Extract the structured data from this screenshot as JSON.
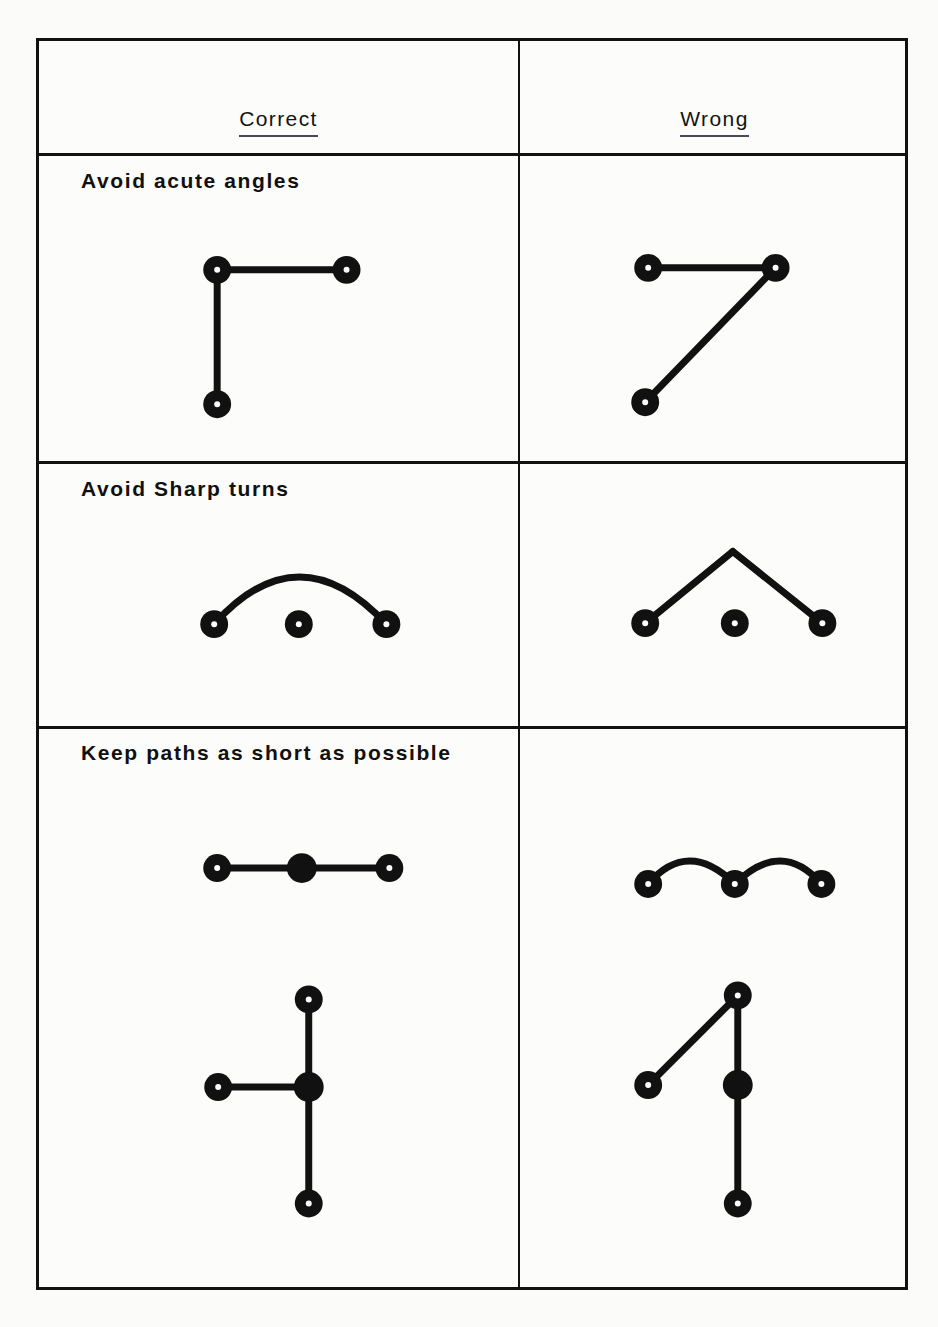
{
  "page": {
    "background_color": "#fcfcfa",
    "ink_color": "#111111"
  },
  "table": {
    "headers": [
      {
        "key": "correct",
        "label": "Correct"
      },
      {
        "key": "wrong",
        "label": "Wrong"
      }
    ],
    "rows": [
      {
        "id": "row-acute-angles",
        "label": "Avoid  acute  angles"
      },
      {
        "id": "row-sharp-turns",
        "label": "Avoid  Sharp  turns"
      },
      {
        "id": "row-short-paths",
        "label": "Keep  paths  as  short  as  possible"
      }
    ]
  },
  "diagrams": {
    "row1_correct": {
      "name": "right-angle-path",
      "description": "Two segments meeting at a 90 degree corner",
      "nodes": [
        {
          "x": 215,
          "y": 267,
          "style": "terminal"
        },
        {
          "x": 345,
          "y": 267,
          "style": "terminal"
        },
        {
          "x": 215,
          "y": 402,
          "style": "terminal"
        }
      ],
      "segments": [
        {
          "from": [
            215,
            267
          ],
          "to": [
            345,
            267
          ]
        },
        {
          "from": [
            215,
            267
          ],
          "to": [
            215,
            402
          ]
        }
      ]
    },
    "row1_wrong": {
      "name": "acute-angle-path",
      "description": "Two segments meeting at a sharp acute angle",
      "nodes": [
        {
          "x": 648,
          "y": 265,
          "style": "terminal"
        },
        {
          "x": 776,
          "y": 265,
          "style": "terminal"
        },
        {
          "x": 645,
          "y": 400,
          "style": "terminal"
        }
      ],
      "segments": [
        {
          "from": [
            648,
            265
          ],
          "to": [
            776,
            265
          ]
        },
        {
          "from": [
            776,
            265
          ],
          "to": [
            645,
            400
          ]
        }
      ]
    },
    "row2_correct": {
      "name": "smooth-arc-path",
      "description": "Smooth curved arc between two terminals, unconnected middle node",
      "nodes": [
        {
          "x": 212,
          "y": 623,
          "style": "terminal"
        },
        {
          "x": 297,
          "y": 623,
          "style": "terminal"
        },
        {
          "x": 385,
          "y": 623,
          "style": "terminal"
        }
      ],
      "curve": {
        "from": [
          212,
          623
        ],
        "control": [
          297,
          528
        ],
        "to": [
          385,
          623
        ]
      }
    },
    "row2_wrong": {
      "name": "sharp-peak-path",
      "description": "Two straight segments forming a sharp peak, unconnected middle node",
      "nodes": [
        {
          "x": 645,
          "y": 622,
          "style": "terminal"
        },
        {
          "x": 735,
          "y": 622,
          "style": "terminal"
        },
        {
          "x": 823,
          "y": 622,
          "style": "terminal"
        }
      ],
      "segments": [
        {
          "from": [
            645,
            622
          ],
          "to": [
            733,
            550
          ]
        },
        {
          "from": [
            733,
            550
          ],
          "to": [
            823,
            622
          ]
        }
      ]
    },
    "row3a_correct": {
      "name": "straight-short-path",
      "description": "Straight horizontal run through a solid junction node",
      "nodes": [
        {
          "x": 215,
          "y": 868,
          "style": "terminal"
        },
        {
          "x": 300,
          "y": 868,
          "style": "junction"
        },
        {
          "x": 388,
          "y": 868,
          "style": "terminal"
        }
      ],
      "segments": [
        {
          "from": [
            215,
            868
          ],
          "to": [
            388,
            868
          ]
        }
      ]
    },
    "row3a_wrong": {
      "name": "wavy-long-path",
      "description": "Unnecessarily long wavy path with two humps",
      "nodes": [
        {
          "x": 648,
          "y": 884,
          "style": "terminal"
        },
        {
          "x": 735,
          "y": 884,
          "style": "terminal"
        },
        {
          "x": 822,
          "y": 884,
          "style": "terminal"
        }
      ],
      "wave": {
        "from": [
          648,
          884
        ],
        "c1": [
          688,
          838
        ],
        "mid": [
          735,
          884
        ],
        "c2": [
          782,
          838
        ],
        "to": [
          822,
          884
        ]
      }
    },
    "row3b_correct": {
      "name": "tee-junction-path",
      "description": "Orthogonal tee: vertical run through solid junction with left branch",
      "nodes": [
        {
          "x": 307,
          "y": 1000,
          "style": "terminal"
        },
        {
          "x": 216,
          "y": 1088,
          "style": "terminal"
        },
        {
          "x": 307,
          "y": 1088,
          "style": "junction"
        },
        {
          "x": 307,
          "y": 1205,
          "style": "terminal"
        }
      ],
      "segments": [
        {
          "from": [
            307,
            1000
          ],
          "to": [
            307,
            1205
          ]
        },
        {
          "from": [
            216,
            1088
          ],
          "to": [
            307,
            1088
          ]
        }
      ]
    },
    "row3b_wrong": {
      "name": "diagonal-junction-path",
      "description": "Diagonal branch to top node plus vertical run through solid junction",
      "nodes": [
        {
          "x": 738,
          "y": 996,
          "style": "terminal"
        },
        {
          "x": 648,
          "y": 1086,
          "style": "terminal"
        },
        {
          "x": 738,
          "y": 1086,
          "style": "junction"
        },
        {
          "x": 738,
          "y": 1205,
          "style": "terminal"
        }
      ],
      "segments": [
        {
          "from": [
            648,
            1086
          ],
          "to": [
            738,
            996
          ]
        },
        {
          "from": [
            738,
            996
          ],
          "to": [
            738,
            1205
          ]
        }
      ]
    }
  },
  "style": {
    "line_width": 7,
    "node_outer_radius": 14,
    "node_inner_radius": 3,
    "junction_radius": 15
  }
}
